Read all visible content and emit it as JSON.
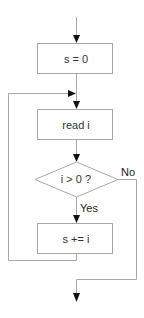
{
  "diagram": {
    "type": "flowchart",
    "nodes": [
      {
        "id": "init",
        "shape": "process",
        "label": "s = 0"
      },
      {
        "id": "read",
        "shape": "process",
        "label": "read i"
      },
      {
        "id": "cond",
        "shape": "decision",
        "label": "i > 0 ?"
      },
      {
        "id": "accumulate",
        "shape": "process",
        "label": "s += i"
      }
    ],
    "edges": [
      {
        "from": "start",
        "to": "init",
        "label": ""
      },
      {
        "from": "init",
        "to": "read",
        "label": ""
      },
      {
        "from": "read",
        "to": "cond",
        "label": ""
      },
      {
        "from": "cond",
        "to": "accumulate",
        "label": "Yes"
      },
      {
        "from": "accumulate",
        "to": "read",
        "label": ""
      },
      {
        "from": "cond",
        "to": "end",
        "label": "No"
      }
    ],
    "colors": {
      "stroke": "#a8a8a8",
      "arrowhead": "#111111",
      "text": "#333333",
      "background": "#ffffff"
    }
  }
}
